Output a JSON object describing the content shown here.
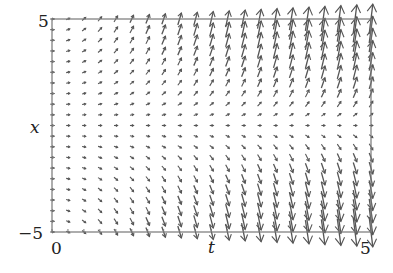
{
  "chart_data": {
    "type": "quiver",
    "title": "",
    "xlabel": "t",
    "ylabel": "x",
    "xlim": [
      0,
      5
    ],
    "ylim": [
      -5,
      5
    ],
    "x_tick_labels": [
      "0",
      "5"
    ],
    "y_tick_labels": [
      "5",
      "−5"
    ],
    "grid": false,
    "legend": null,
    "field": {
      "description": "Direction field: arrows point upward for x>0 and downward for x<0, horizontal near x=0; magnitude grows with t and |x|",
      "dt_expression": "1",
      "dx_expression": "t*x",
      "t_samples": 21,
      "x_samples": 21,
      "arrow_color": "#555555"
    }
  },
  "labels": {
    "ytick_top": "5",
    "ytick_bottom": "−5",
    "xtick_left": "0",
    "xtick_right": "5",
    "xlabel": "t",
    "ylabel": "x"
  },
  "colors": {
    "axis": "#777777",
    "arrow": "#555555",
    "text": "#222222"
  }
}
